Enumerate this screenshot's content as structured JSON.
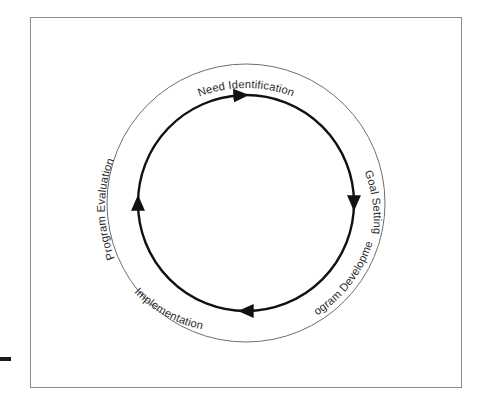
{
  "diagram": {
    "type": "circular-cycle",
    "direction": "clockwise",
    "colors": {
      "frame_border": "#8d8d8d",
      "outer_circle": "#6f6f6f",
      "inner_circle": "#111111",
      "label_text": "#2b2b2b",
      "background": "#ffffff",
      "tick_mark": "#1b1b1b"
    },
    "stages": [
      {
        "id": "need-identification",
        "label": "Need Identification",
        "position": "top",
        "angle_deg": 270
      },
      {
        "id": "goal-setting",
        "label": "Goal Setting",
        "position": "right",
        "angle_deg": 342
      },
      {
        "id": "program-development",
        "label": "Program Development",
        "position": "bottom-right",
        "angle_deg": 52
      },
      {
        "id": "implementation",
        "label": "Implementation",
        "position": "bottom-left",
        "angle_deg": 124
      },
      {
        "id": "program-evaluation",
        "label": "Program Evaluation",
        "position": "left",
        "angle_deg": 198
      }
    ],
    "arrows": [
      {
        "id": "arrow-top",
        "points": "right",
        "position": "top"
      },
      {
        "id": "arrow-right",
        "points": "down",
        "position": "right"
      },
      {
        "id": "arrow-bottom",
        "points": "left",
        "position": "bottom"
      },
      {
        "id": "arrow-left",
        "points": "up",
        "position": "left"
      }
    ],
    "geometry": {
      "center_x": 246,
      "center_y": 203,
      "outer_radius": 139,
      "inner_radius": 108,
      "label_radius": 131
    }
  }
}
